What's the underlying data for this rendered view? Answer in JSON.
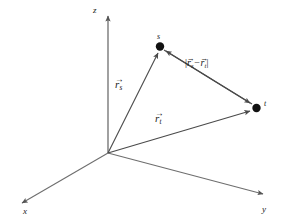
{
  "diagram": {
    "background_color": "#ffffff",
    "line_color": "#4a4a4a",
    "axis_color": "#6e6e6e",
    "text_color": "#1a1a1a",
    "axes": [
      {
        "name": "x",
        "label": "x",
        "direction": "down-left"
      },
      {
        "name": "y",
        "label": "y",
        "direction": "right-down"
      },
      {
        "name": "z",
        "label": "z",
        "direction": "up"
      }
    ],
    "origin": {
      "label": "",
      "x": 108,
      "y": 153
    },
    "points": [
      {
        "name": "s",
        "label": "s",
        "x": 160,
        "y": 47
      },
      {
        "name": "t",
        "label": "t",
        "x": 256,
        "y": 108
      }
    ],
    "vectors": [
      {
        "name": "r-s",
        "symbol": "r",
        "subscript": "s",
        "arrow_accent": "→",
        "from": "origin",
        "to": "s"
      },
      {
        "name": "r-t",
        "symbol": "r",
        "subscript": "t",
        "arrow_accent": "→",
        "from": "origin",
        "to": "t"
      },
      {
        "name": "r-s-minus-r-t",
        "bar_open": "|",
        "bar_close": "|",
        "symbol_1": "r",
        "subscript_1": "s",
        "operator": "−",
        "symbol_2": "r",
        "subscript_2": "t",
        "arrow_accent": "→",
        "from": "t",
        "to": "s"
      }
    ]
  }
}
